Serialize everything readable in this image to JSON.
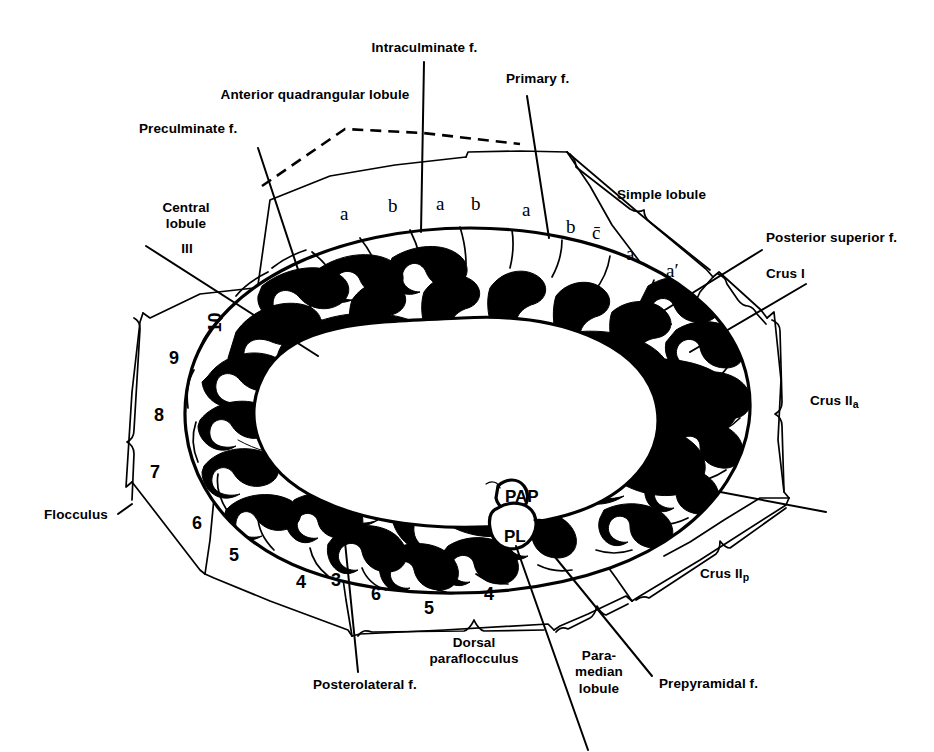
{
  "figure": {
    "kind": "anatomical-diagram",
    "ink_color": "#000000",
    "background_color": "#ffffff",
    "width": 934,
    "height": 752
  },
  "labels": {
    "intraculminate_f": "Intraculminate f.",
    "anterior_quadrangular_lobule": "Anterior quadrangular lobule",
    "primary_f": "Primary f.",
    "preculminate_f": "Preculminate f.",
    "central_lobule": "Central\nlobule",
    "central_lobule_roman": "III",
    "simple_lobule": "Simple lobule",
    "posterior_superior_f": "Posterior superior f.",
    "crus_I": "Crus I",
    "crus_IIa_main": "Crus II",
    "crus_IIa_sub": "a",
    "crus_IIp_main": "Crus II",
    "crus_IIp_sub": "p",
    "flocculus": "Flocculus",
    "dorsal_paraflocculus": "Dorsal\nparaflocculus",
    "posterolateral_f": "Posterolateral f.",
    "paramedian_lobule": "Para-\nmedian\nlobule",
    "prepyramidal_f": "Prepyramidal f.",
    "pap": "PAP",
    "pl": "PL"
  },
  "folia_letters": [
    {
      "text": "a",
      "x": 340,
      "y": 203
    },
    {
      "text": "b",
      "x": 388,
      "y": 195
    },
    {
      "text": "a",
      "x": 436,
      "y": 193
    },
    {
      "text": "b",
      "x": 471,
      "y": 193
    },
    {
      "text": "a",
      "x": 522,
      "y": 199
    },
    {
      "text": "b",
      "x": 566,
      "y": 216
    },
    {
      "text": "c̄",
      "x": 592,
      "y": 222
    },
    {
      "text": "a",
      "x": 626,
      "y": 243
    },
    {
      "text": "a′",
      "x": 666,
      "y": 260
    }
  ],
  "vermis_numbers": [
    {
      "text": "10",
      "x": 205,
      "y": 312,
      "rotated": true
    },
    {
      "text": "9",
      "x": 169,
      "y": 348,
      "rotated": false
    },
    {
      "text": "8",
      "x": 154,
      "y": 405,
      "rotated": false
    },
    {
      "text": "7",
      "x": 150,
      "y": 462,
      "rotated": false
    },
    {
      "text": "6",
      "x": 192,
      "y": 513,
      "rotated": false
    },
    {
      "text": "5",
      "x": 229,
      "y": 545,
      "rotated": false
    },
    {
      "text": "4",
      "x": 296,
      "y": 572,
      "rotated": false
    },
    {
      "text": "3",
      "x": 331,
      "y": 570,
      "rotated": false
    },
    {
      "text": "6",
      "x": 371,
      "y": 584,
      "rotated": false
    },
    {
      "text": "5",
      "x": 424,
      "y": 598,
      "rotated": false
    },
    {
      "text": "4",
      "x": 484,
      "y": 584,
      "rotated": false
    }
  ],
  "colors": {
    "ink": "#000000",
    "paper": "#ffffff"
  }
}
